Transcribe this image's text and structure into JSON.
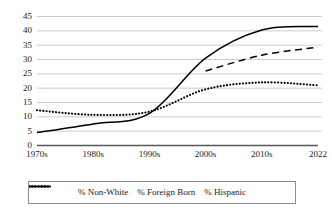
{
  "chart_data": {
    "type": "line",
    "title": "",
    "xlabel": "",
    "ylabel": "",
    "categories": [
      "1970s",
      "1980s",
      "1990s",
      "2000s",
      "2010s",
      "2022"
    ],
    "ylim": [
      0,
      45
    ],
    "yticks": [
      0,
      5,
      10,
      15,
      20,
      25,
      30,
      35,
      40,
      45
    ],
    "grid": true,
    "legend_position": "bottom",
    "series": [
      {
        "name": "% Non-White",
        "style": "solid",
        "color": "#000000",
        "values": [
          4.5,
          7.5,
          11.2,
          30.5,
          40.3,
          41.5
        ]
      },
      {
        "name": "% Foreign Born",
        "style": "dotted",
        "color": "#000000",
        "values": [
          12.3,
          10.7,
          11.8,
          19.6,
          22.0,
          21.0
        ]
      },
      {
        "name": "% Hispanic",
        "style": "dashed",
        "color": "#000000",
        "values": [
          null,
          null,
          null,
          26.0,
          31.5,
          34.3
        ]
      }
    ]
  },
  "legend": {
    "items": [
      {
        "label": "% Non-White",
        "icon": "solid-line-swatch"
      },
      {
        "label": "% Foreign Born",
        "icon": "dotted-line-swatch"
      },
      {
        "label": "% Hispanic",
        "icon": "dashed-line-swatch"
      }
    ]
  },
  "axes": {
    "y_tick_labels": [
      "45",
      "40",
      "35",
      "30",
      "25",
      "20",
      "15",
      "10",
      "5",
      "0"
    ],
    "x_tick_labels": [
      "1970s",
      "1980s",
      "1990s",
      "2000s",
      "2010s",
      "2022"
    ]
  }
}
